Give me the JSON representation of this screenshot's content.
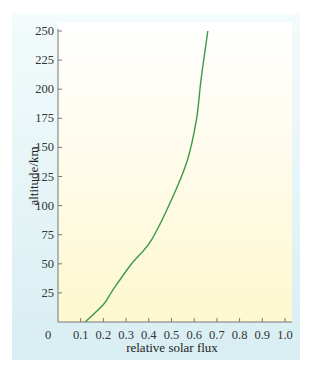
{
  "chart_data": {
    "type": "line",
    "title": "",
    "xlabel": "relative solar flux",
    "ylabel": "altitude/km",
    "xlim": [
      0,
      1.0
    ],
    "ylim": [
      0,
      250
    ],
    "x_ticks": [
      "0",
      "0.1",
      "0.2",
      "0.3",
      "0.4",
      "0.5",
      "0.6",
      "0.7",
      "0.8",
      "0.9",
      "1.0"
    ],
    "y_ticks": [
      "25",
      "50",
      "75",
      "100",
      "125",
      "150",
      "175",
      "200",
      "225",
      "250"
    ],
    "grid": false,
    "legend": null,
    "series": [
      {
        "name": "solar flux",
        "color": "#3c9a4a",
        "points": [
          {
            "x": 0.12,
            "y": 0
          },
          {
            "x": 0.2,
            "y": 15
          },
          {
            "x": 0.24,
            "y": 27
          },
          {
            "x": 0.32,
            "y": 49
          },
          {
            "x": 0.41,
            "y": 70
          },
          {
            "x": 0.5,
            "y": 105
          },
          {
            "x": 0.57,
            "y": 139
          },
          {
            "x": 0.61,
            "y": 174
          },
          {
            "x": 0.63,
            "y": 208
          },
          {
            "x": 0.66,
            "y": 250
          }
        ]
      }
    ]
  }
}
